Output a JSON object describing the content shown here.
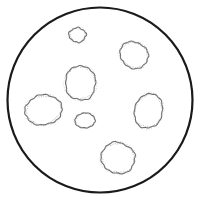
{
  "figure": {
    "type": "line-drawing",
    "width": 201,
    "height": 201,
    "background_color": "#ffffff"
  },
  "dish": {
    "label": "petri-dish-rim",
    "shape": "circle",
    "center_x": 100,
    "center_y": 100,
    "radius": 92.5,
    "stroke_color": "#1a1a1a",
    "stroke_width": 2.2,
    "fill_color": "#ffffff"
  },
  "colonies": {
    "count": 7,
    "stroke_color": "#6e6e6e",
    "texture_color": "#8c8c8c",
    "fill_color": "#ffffff",
    "stroke_width": 1.1,
    "items": [
      {
        "id": "colony-1",
        "label": "small top colony",
        "center_x": 77.5,
        "center_y": 35,
        "radius_x": 8,
        "radius_y": 7.5,
        "rotation": -12,
        "size": "small",
        "wobble": 1.1,
        "lobes": 9,
        "seed": 11
      },
      {
        "id": "colony-2",
        "label": "upper right colony",
        "center_x": 134,
        "center_y": 55,
        "radius_x": 14.5,
        "radius_y": 13,
        "rotation": 24,
        "size": "medium",
        "wobble": 1.3,
        "lobes": 11,
        "seed": 23
      },
      {
        "id": "colony-3",
        "label": "upper center colony",
        "center_x": 80.5,
        "center_y": 83,
        "radius_x": 15.5,
        "radius_y": 17,
        "rotation": -8,
        "size": "large",
        "wobble": 1.2,
        "lobes": 12,
        "seed": 37
      },
      {
        "id": "colony-4",
        "label": "left colony",
        "center_x": 43.5,
        "center_y": 110,
        "radius_x": 18.5,
        "radius_y": 15,
        "rotation": -6,
        "size": "large",
        "wobble": 1.4,
        "lobes": 13,
        "seed": 53
      },
      {
        "id": "colony-5",
        "label": "small center colony",
        "center_x": 85,
        "center_y": 120.5,
        "radius_x": 10,
        "radius_y": 7.5,
        "rotation": -4,
        "size": "small",
        "wobble": 1.0,
        "lobes": 10,
        "seed": 67
      },
      {
        "id": "colony-6",
        "label": "right colony",
        "center_x": 148.5,
        "center_y": 111,
        "radius_x": 14,
        "radius_y": 17.5,
        "rotation": 18,
        "size": "large",
        "wobble": 1.2,
        "lobes": 12,
        "seed": 79
      },
      {
        "id": "colony-7",
        "label": "lower center colony",
        "center_x": 118,
        "center_y": 158,
        "radius_x": 17,
        "radius_y": 15.5,
        "rotation": 10,
        "size": "large",
        "wobble": 1.3,
        "lobes": 12,
        "seed": 97
      }
    ]
  }
}
